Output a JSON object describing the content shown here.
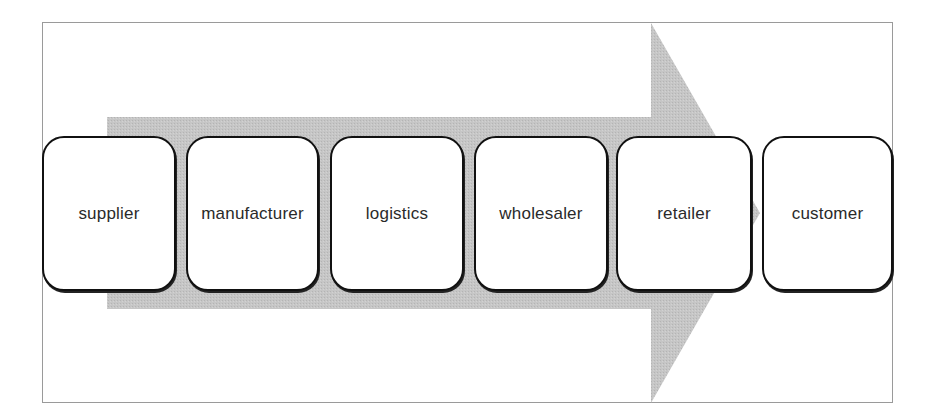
{
  "diagram": {
    "type": "process-flow",
    "arrow": {
      "direction": "right",
      "color": "#c4c4c4"
    },
    "stages": [
      {
        "label": "supplier"
      },
      {
        "label": "manufacturer"
      },
      {
        "label": "logistics"
      },
      {
        "label": "wholesaler"
      },
      {
        "label": "retailer"
      },
      {
        "label": "customer"
      }
    ]
  }
}
